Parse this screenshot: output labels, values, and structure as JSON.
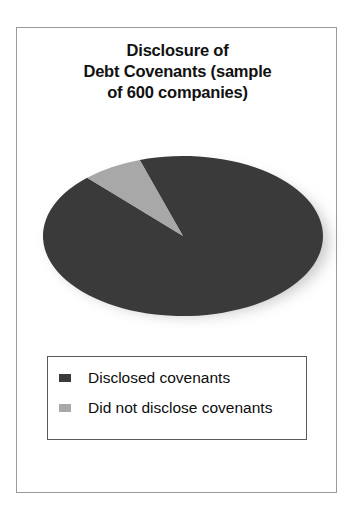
{
  "figure": {
    "title_lines": [
      "Disclosure of",
      "Debt Covenants (sample",
      "of 600 companies)"
    ],
    "title_text": "Disclosure of Debt Covenants (sample of 600 companies)"
  },
  "legend": {
    "items": [
      {
        "label": "Disclosed covenants",
        "color": "#3a3a3a",
        "swatch_icon": "legend-swatch-dark"
      },
      {
        "label": "Did not disclose covenants",
        "color": "#a8a8a8",
        "swatch_icon": "legend-swatch-light"
      }
    ]
  },
  "colors": {
    "slice_disclosed": "#3a3a3a",
    "slice_not_disclosed": "#a8a8a8",
    "frame_border": "#9a9a9a",
    "legend_border": "#5a5a5a",
    "shadow": "#b9b9b9",
    "background": "#ffffff",
    "text": "#111111"
  },
  "chart_data": {
    "type": "pie",
    "title": "Disclosure of Debt Covenants (sample of 600 companies)",
    "categories": [
      "Disclosed covenants",
      "Did not disclose covenants"
    ],
    "values": [
      558,
      42
    ],
    "percentages": [
      93,
      7
    ],
    "value_unit": "companies",
    "total": 600,
    "sample_size": 600,
    "colors": [
      "#3a3a3a",
      "#a8a8a8"
    ],
    "start_angle_deg": -18,
    "direction": "clockwise",
    "legend_position": "bottom",
    "data_labels": false,
    "grid": false,
    "three_d": true,
    "xlabel": "",
    "ylabel": ""
  }
}
